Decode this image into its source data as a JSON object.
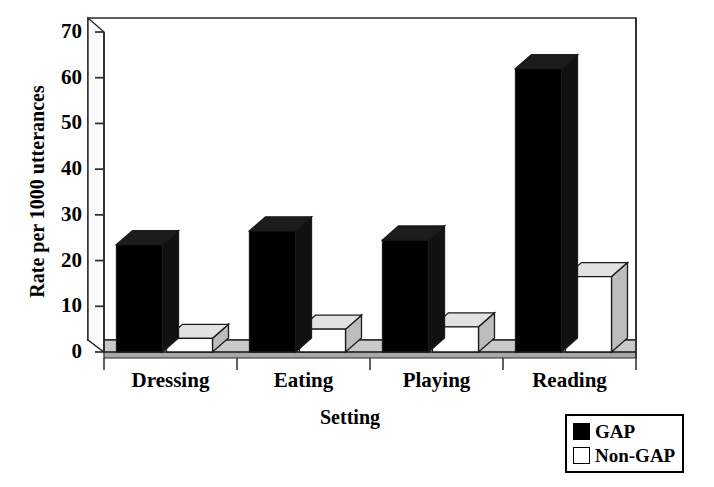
{
  "chart_data": {
    "type": "bar",
    "title": "",
    "xlabel": "Setting",
    "ylabel": "Rate per 1000 utterances",
    "categories": [
      "Dressing",
      "Eating",
      "Playing",
      "Reading"
    ],
    "series": [
      {
        "name": "GAP",
        "color": "#000000",
        "values": [
          23.5,
          26.5,
          24.5,
          62.0
        ]
      },
      {
        "name": "Non-GAP",
        "color": "#ffffff",
        "values": [
          3.0,
          5.0,
          5.5,
          16.5
        ]
      }
    ],
    "ylim": [
      0,
      70
    ],
    "yticks": [
      0,
      10,
      20,
      30,
      40,
      50,
      60,
      70
    ],
    "ytick_labels": [
      "0",
      "10",
      "20",
      "30",
      "40",
      "50",
      "60",
      "70"
    ],
    "grid": false,
    "legend_position": "bottom-right",
    "style": "3d-column"
  },
  "legend": {
    "entries": [
      {
        "label": "GAP",
        "swatch": "#000000"
      },
      {
        "label": "Non-GAP",
        "swatch": "#ffffff"
      }
    ]
  }
}
